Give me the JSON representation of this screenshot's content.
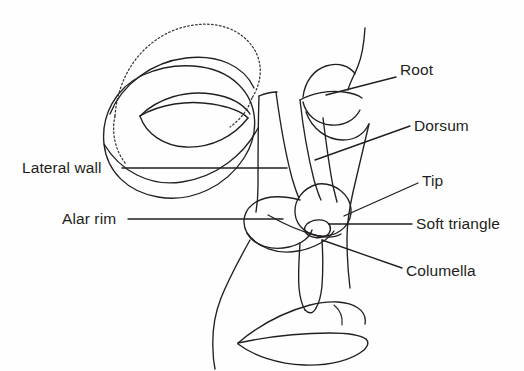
{
  "figure": {
    "type": "line-drawing-anatomical-diagram",
    "background_color": "#fefefe",
    "line_color": "#231f20",
    "labels": [
      {
        "id": "root",
        "text": "Root",
        "side": "right",
        "x": 400,
        "y": 62,
        "leader": {
          "from_x": 396,
          "from_y": 77,
          "to_x": 326,
          "to_y": 95
        }
      },
      {
        "id": "dorsum",
        "text": "Dorsum",
        "side": "right",
        "x": 414,
        "y": 118,
        "leader": {
          "from_x": 410,
          "from_y": 126,
          "to_x": 315,
          "to_y": 160
        }
      },
      {
        "id": "tip",
        "text": "Tip",
        "side": "right",
        "x": 422,
        "y": 173,
        "leader": {
          "from_x": 418,
          "from_y": 183,
          "to_x": 344,
          "to_y": 216
        }
      },
      {
        "id": "soft-triangle",
        "text": "Soft triangle",
        "side": "right",
        "x": 416,
        "y": 216,
        "leader": {
          "from_x": 412,
          "from_y": 224,
          "to_x": 329,
          "to_y": 224
        }
      },
      {
        "id": "columella",
        "text": "Columella",
        "side": "right",
        "x": 406,
        "y": 263,
        "leader": {
          "from_x": 402,
          "from_y": 268,
          "to_x": 322,
          "to_y": 240
        }
      },
      {
        "id": "lateral-wall",
        "text": "Lateral wall",
        "side": "left",
        "x": 22,
        "y": 160,
        "leader": {
          "from_x": 122,
          "from_y": 168,
          "to_x": 287,
          "to_y": 168
        }
      },
      {
        "id": "alar-rim",
        "text": "Alar rim",
        "side": "left",
        "x": 62,
        "y": 211,
        "leader": {
          "from_x": 128,
          "from_y": 219,
          "to_x": 283,
          "to_y": 219
        }
      }
    ]
  }
}
